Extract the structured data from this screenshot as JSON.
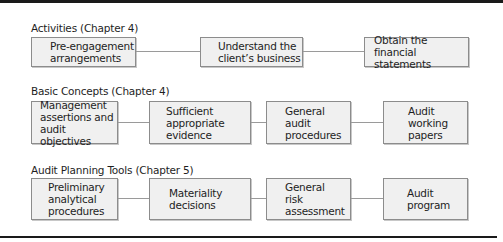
{
  "rows": [
    {
      "heading": "Activities (Chapter 4)",
      "boxes": [
        {
          "label": "Pre-engagement\narrangements"
        },
        {
          "label": "Understand the\nclient’s business"
        },
        {
          "label": "Obtain the\nfinancial statements"
        }
      ]
    },
    {
      "heading": "Basic Concepts (Chapter 4)",
      "boxes": [
        {
          "label": "Management\nassertions and\naudit objectives"
        },
        {
          "label": "Sufficient\nappropriate\nevidence"
        },
        {
          "label": "General\naudit\nprocedures"
        },
        {
          "label": "Audit\nworking\npapers"
        }
      ]
    },
    {
      "heading": "Audit Planning Tools (Chapter 5)",
      "boxes": [
        {
          "label": "Preliminary\nanalytical\nprocedures"
        },
        {
          "label": "Materiality\ndecisions"
        },
        {
          "label": "General\nrisk\nassessment"
        },
        {
          "label": "Audit\nprogram"
        }
      ]
    }
  ],
  "colors": {
    "box_fill": "#f0f0f0",
    "box_border": "#8c8c8c",
    "connector": "#9a9a9a",
    "rule": "#1a1a1a"
  }
}
